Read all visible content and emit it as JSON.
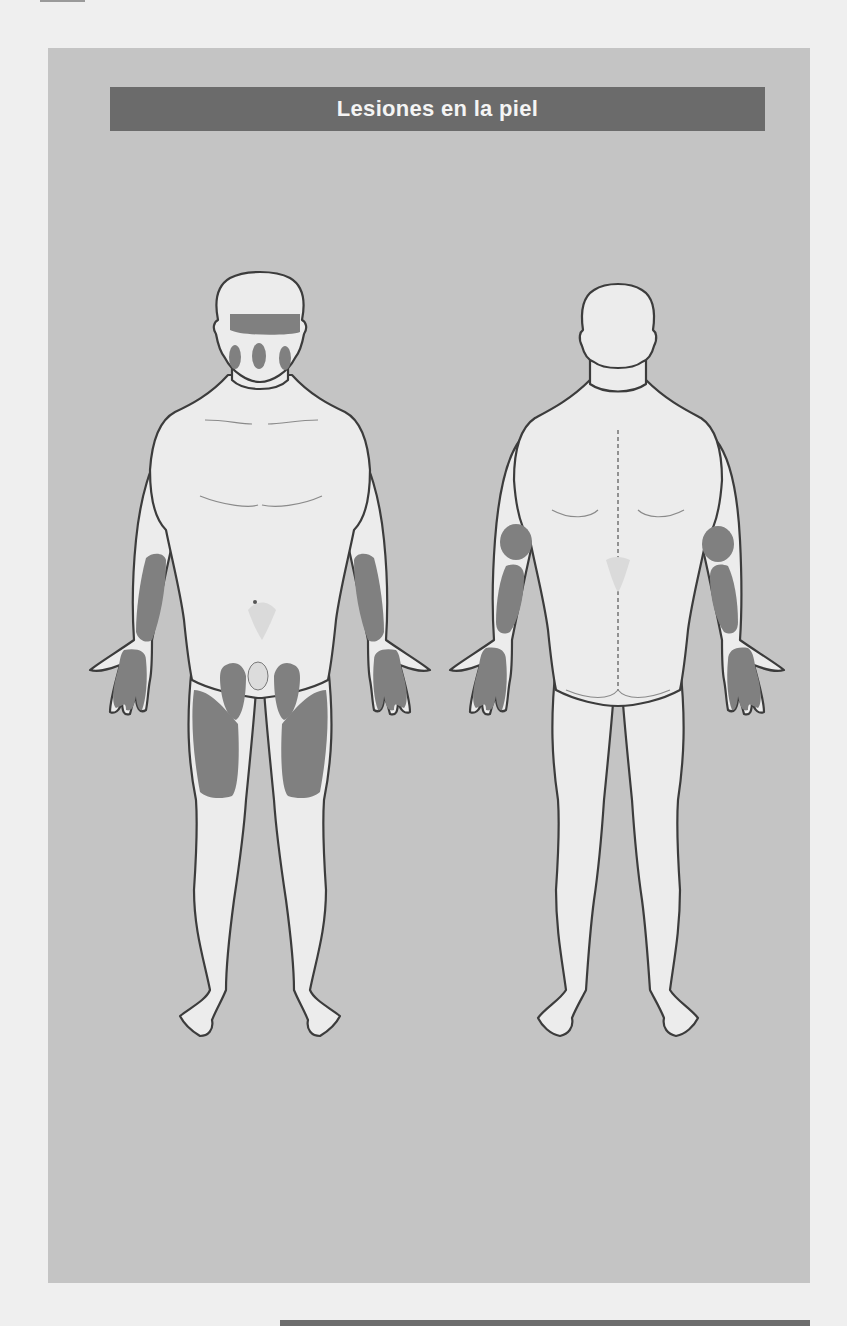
{
  "header": {
    "title": "Lesiones en la piel"
  },
  "diagram": {
    "type": "body-map",
    "views": [
      {
        "id": "front",
        "label": "Vista frontal",
        "highlighted_regions": [
          "forehead",
          "left-cheek",
          "nose",
          "right-cheek",
          "left-forearm",
          "right-forearm",
          "left-palm-hand",
          "right-palm-hand",
          "left-groin",
          "right-groin",
          "left-thigh-front",
          "right-thigh-front"
        ]
      },
      {
        "id": "back",
        "label": "Vista posterior",
        "highlighted_regions": [
          "left-elbow",
          "right-elbow",
          "left-forearm-back",
          "right-forearm-back",
          "left-hand-back",
          "right-hand-back"
        ]
      }
    ],
    "colors": {
      "background_panel": "#c4c4c4",
      "title_bar": "#6b6b6b",
      "title_text": "#f4f4f4",
      "skin": "#ececec",
      "outline": "#3c3c3c",
      "lesion": "#808080",
      "page": "#efefef"
    }
  }
}
